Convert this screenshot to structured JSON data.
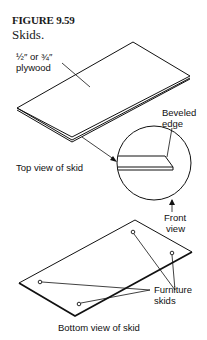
{
  "figure": {
    "number": "FIGURE 9.59",
    "caption": "Skids."
  },
  "labels": {
    "plywood_line1": "½″ or ¾″",
    "plywood_line2": "plywood",
    "beveled_line1": "Beveled",
    "beveled_line2": "edge",
    "top_view": "Top view of skid",
    "front_line1": "Front",
    "front_line2": "view",
    "furniture_line1": "Furniture",
    "furniture_line2": "skids",
    "bottom_view": "Bottom view of skid"
  },
  "colors": {
    "line": "#111111",
    "background": "#ffffff"
  }
}
